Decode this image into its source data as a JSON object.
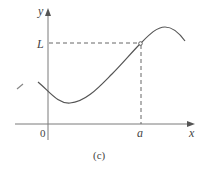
{
  "figure": {
    "caption": "(c)",
    "colors": {
      "axis": "#7a7a7a",
      "curve": "#555555",
      "dashed": "#666666",
      "text": "#444444",
      "background": "#ffffff"
    },
    "axes": {
      "x_label": "x",
      "y_label": "y",
      "origin_label": "0"
    },
    "markers": {
      "horizontal_label": "L",
      "vertical_label": "a"
    },
    "curve": {
      "description": "smooth curve dipping to a minimum then rising to the point (a, L), peaking and descending",
      "open_point_at": [
        "a",
        "L"
      ]
    }
  }
}
